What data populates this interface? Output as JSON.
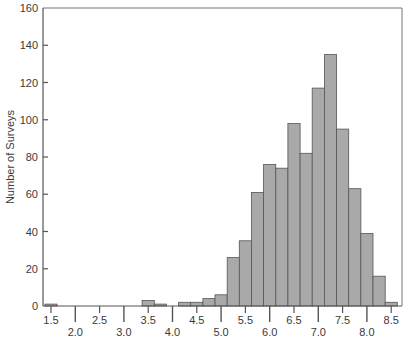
{
  "chart_data": {
    "type": "bar",
    "title": "",
    "xlabel": "",
    "ylabel": "Number of Surveys",
    "ylim": [
      0,
      160
    ],
    "xlim": [
      1.3,
      8.7
    ],
    "bin_width": 0.25,
    "grid": false,
    "legend": null,
    "y_ticks": [
      0,
      20,
      40,
      60,
      80,
      100,
      120,
      140,
      160
    ],
    "x_major_ticks": [
      "2.0",
      "3.0",
      "4.0",
      "5.0",
      "6.0",
      "7.0",
      "8.0"
    ],
    "x_minor_ticks": [
      "1.5",
      "2.5",
      "3.5",
      "4.5",
      "5.5",
      "6.5",
      "7.5",
      "8.5"
    ],
    "x": [
      1.5,
      3.5,
      3.75,
      4.0,
      4.25,
      4.5,
      4.75,
      5.0,
      5.25,
      5.5,
      5.75,
      6.0,
      6.25,
      6.5,
      6.75,
      7.0,
      7.25,
      7.5,
      7.75,
      8.0,
      8.25,
      8.5
    ],
    "values": [
      1,
      3,
      1,
      0,
      2,
      2,
      4,
      6,
      26,
      35,
      61,
      76,
      74,
      98,
      82,
      117,
      135,
      95,
      63,
      39,
      16,
      2
    ],
    "colors": {
      "bar_fill": "#a9a9a9",
      "bar_stroke": "#555555",
      "axis": "#555555",
      "frame": "#777777",
      "text": "#3a3a3a"
    }
  }
}
